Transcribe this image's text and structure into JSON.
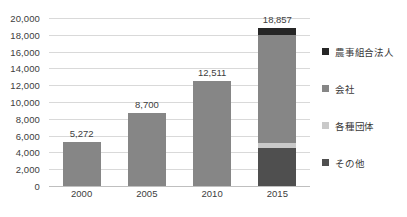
{
  "chart_data": {
    "type": "bar",
    "title": "",
    "xlabel": "",
    "ylabel": "",
    "categories": [
      "2000",
      "2005",
      "2010",
      "2015"
    ],
    "totals": [
      5272,
      8700,
      12511,
      18857
    ],
    "total_labels": [
      "5,272",
      "8,700",
      "12,511",
      "18,857"
    ],
    "ylim": [
      0,
      20000
    ],
    "ytick_step": 2000,
    "yticks": [
      0,
      2000,
      4000,
      6000,
      8000,
      10000,
      12000,
      14000,
      16000,
      18000,
      20000
    ],
    "ytick_labels": [
      "0",
      "2,000",
      "4,000",
      "6,000",
      "8,000",
      "10,000",
      "12,000",
      "14,000",
      "16,000",
      "18,000",
      "20,000"
    ],
    "grid": true,
    "legend_position": "right",
    "stacked": true,
    "series": [
      {
        "name": "農事組合法人",
        "color": "#262626",
        "values": [
          0,
          0,
          0,
          857
        ]
      },
      {
        "name": "会社",
        "color": "#868686",
        "values": [
          5272,
          8700,
          12511,
          12900
        ]
      },
      {
        "name": "各種団体",
        "color": "#c9c9c9",
        "values": [
          0,
          0,
          0,
          600
        ]
      },
      {
        "name": "その他",
        "color": "#4f4f4f",
        "values": [
          0,
          0,
          0,
          4500
        ]
      }
    ]
  },
  "legend": {
    "items": [
      {
        "label": "農事組合法人",
        "color": "#262626"
      },
      {
        "label": "会社",
        "color": "#868686"
      },
      {
        "label": "各種団体",
        "color": "#c9c9c9"
      },
      {
        "label": "その他",
        "color": "#4f4f4f"
      }
    ]
  },
  "axis": {
    "gridline_color": "#d9d9d9",
    "baseline_color": "#bfbfbf",
    "text_color": "#404040"
  }
}
